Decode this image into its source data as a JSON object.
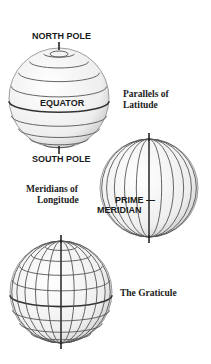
{
  "labels": {
    "north_pole": "NORTH POLE",
    "equator": "EQUATOR",
    "south_pole": "SOUTH POLE",
    "parallels_line1": "Parallels of",
    "parallels_line2": "Latitude",
    "meridians_line1": "Meridians of",
    "meridians_line2": "Longitude",
    "prime_line1": "PRIME —",
    "prime_line2": "MERIDIAN",
    "graticule": "The Graticule"
  },
  "colors": {
    "line": "#555555",
    "equator_line": "#333333",
    "globe_fill": "#f4f4f4"
  }
}
